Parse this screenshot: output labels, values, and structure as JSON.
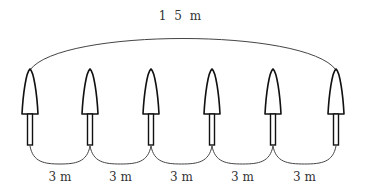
{
  "diagram": {
    "title_label": "1 5 m",
    "total_length": "15m",
    "tree_count": 6,
    "tree_x": [
      30,
      90,
      151,
      212,
      273,
      336
    ],
    "spacing_labels": [
      "3 m",
      "3 m",
      "3 m",
      "3 m",
      "3 m"
    ],
    "icon": "tree-icon",
    "colors": {
      "stroke": "#111111",
      "arc": "#444444",
      "text": "#333333"
    }
  }
}
